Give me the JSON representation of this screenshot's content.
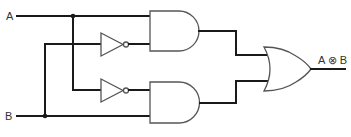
{
  "diagram": {
    "type": "logic-circuit",
    "inputs": [
      {
        "name": "A",
        "label": "A"
      },
      {
        "name": "B",
        "label": "B"
      }
    ],
    "gates": [
      {
        "id": "not-upper",
        "type": "NOT",
        "input": "B"
      },
      {
        "id": "not-lower",
        "type": "NOT",
        "input": "A"
      },
      {
        "id": "and-upper",
        "type": "AND",
        "inputs": [
          "A",
          "NOT B"
        ]
      },
      {
        "id": "and-lower",
        "type": "AND",
        "inputs": [
          "NOT A",
          "B"
        ]
      },
      {
        "id": "or-out",
        "type": "OR",
        "inputs": [
          "and-upper",
          "and-lower"
        ]
      }
    ],
    "output": {
      "label": "A ⊗ B"
    },
    "colors": {
      "wire": "#1a1a1a",
      "gate_outline": "#555555",
      "text": "#333333"
    }
  }
}
